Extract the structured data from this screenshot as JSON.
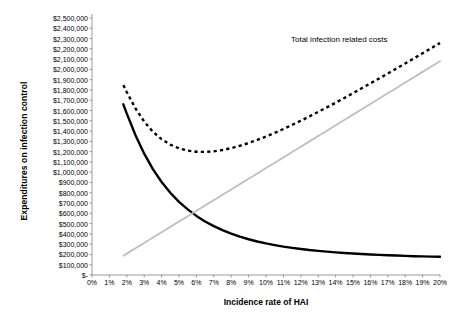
{
  "chart_data": {
    "type": "line",
    "title": "",
    "xlabel": "Incidence rate of HAI",
    "ylabel": "Expenditures on infection control",
    "xlim": [
      0,
      20
    ],
    "ylim": [
      0,
      2500000
    ],
    "grid": false,
    "legend_position": "none",
    "x_tick_labels": [
      "0%",
      "1%",
      "2%",
      "3%",
      "4%",
      "5%",
      "6%",
      "7%",
      "8%",
      "9%",
      "10%",
      "11%",
      "12%",
      "13%",
      "14%",
      "15%",
      "16%",
      "17%",
      "18%",
      "19%",
      "20%"
    ],
    "y_tick_labels": [
      "$2,500,000",
      "$2,400,000",
      "$2,300,000",
      "$2,200,000",
      "$2,100,000",
      "$2,000,000",
      "$1,900,000",
      "$1,800,000",
      "$1,700,000",
      "$1,600,000",
      "$1,500,000",
      "$1,400,000",
      "$1,300,000",
      "$1,200,000",
      "$1,100,000",
      "$1,000,000",
      "$900,000",
      "$800,000",
      "$700,000",
      "$600,000",
      "$500,000",
      "$400,000",
      "$300,000",
      "$200,000",
      "$100,000",
      "$-"
    ],
    "y_tick_values": [
      2500000,
      2400000,
      2300000,
      2200000,
      2100000,
      2000000,
      1900000,
      1800000,
      1700000,
      1600000,
      1500000,
      1400000,
      1300000,
      1200000,
      1100000,
      1000000,
      900000,
      800000,
      700000,
      600000,
      500000,
      400000,
      300000,
      200000,
      100000,
      0
    ],
    "annotations": [
      {
        "name": "total-infection-related-costs",
        "text": "Total infection related costs",
        "x": 15.5,
        "y": 2130000
      }
    ],
    "x": [
      1.8,
      2,
      2.5,
      3,
      3.5,
      4,
      4.5,
      5,
      5.5,
      6,
      6.5,
      7,
      7.5,
      8,
      8.5,
      9,
      9.5,
      10,
      10.5,
      11,
      11.5,
      12,
      12.5,
      13,
      13.5,
      14,
      14.5,
      15,
      15.5,
      16,
      16.5,
      17,
      17.5,
      18,
      18.5,
      19,
      19.5,
      20
    ],
    "series": [
      {
        "name": "Expenditures on infection control",
        "style": "solid",
        "color": "#000000",
        "values": [
          1660000,
          1570000,
          1360000,
          1180000,
          1030000,
          905000,
          800000,
          712000,
          638000,
          575000,
          521000,
          475000,
          436000,
          402000,
          373000,
          348000,
          326000,
          307000,
          291000,
          276000,
          264000,
          253000,
          243000,
          235000,
          227000,
          220000,
          214000,
          209000,
          204000,
          200000,
          196000,
          192000,
          189000,
          186000,
          183000,
          181000,
          179000,
          177000
        ]
      },
      {
        "name": "Infection related costs",
        "style": "solid",
        "color": "#bfbfbf",
        "values": [
          187000,
          208000,
          260000,
          312000,
          364000,
          416000,
          468000,
          520000,
          572000,
          624000,
          676000,
          728000,
          780000,
          832000,
          884000,
          936000,
          988000,
          1040000,
          1092000,
          1144000,
          1196000,
          1248000,
          1300000,
          1352000,
          1404000,
          1456000,
          1508000,
          1560000,
          1612000,
          1664000,
          1716000,
          1768000,
          1820000,
          1872000,
          1924000,
          1976000,
          2028000,
          2080000
        ]
      },
      {
        "name": "Total infection related costs",
        "style": "dashed",
        "color": "#000000",
        "values": [
          1847000,
          1778000,
          1620000,
          1492000,
          1394000,
          1321000,
          1268000,
          1232000,
          1210000,
          1199000,
          1197000,
          1203000,
          1216000,
          1234000,
          1257000,
          1284000,
          1314000,
          1347000,
          1383000,
          1420000,
          1460000,
          1501000,
          1543000,
          1587000,
          1631000,
          1676000,
          1722000,
          1769000,
          1816000,
          1864000,
          1912000,
          1960000,
          2009000,
          2058000,
          2107000,
          2157000,
          2207000,
          2257000
        ]
      }
    ],
    "crossover_point": {
      "x": 6.2,
      "y": 640000
    }
  },
  "axes": {
    "y_title": "Expenditures on infection control",
    "x_title": "Incidence rate of HAI"
  }
}
